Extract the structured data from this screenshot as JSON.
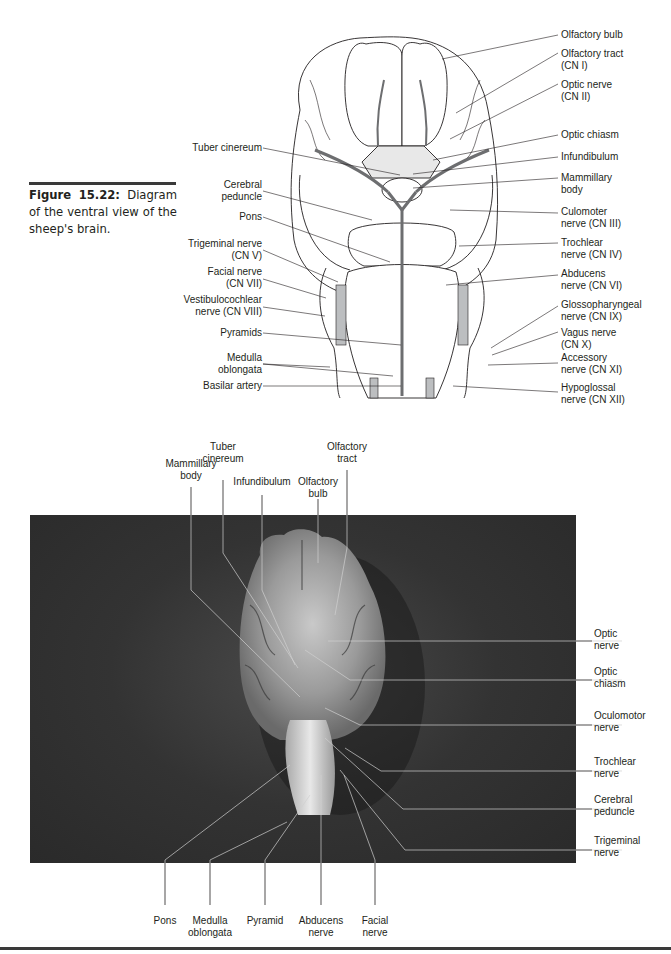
{
  "figure": {
    "number": "Figure 15.22:",
    "caption": "Diagram of the ventral view of the sheep's brain."
  },
  "diagram": {
    "left_labels": [
      {
        "id": "tuber-cinereum",
        "lines": [
          "Tuber cinereum"
        ]
      },
      {
        "id": "cerebral-peduncle",
        "lines": [
          "Cerebral",
          "peduncle"
        ]
      },
      {
        "id": "pons",
        "lines": [
          "Pons"
        ]
      },
      {
        "id": "trigeminal-nerve",
        "lines": [
          "Trigeminal nerve",
          "(CN V)"
        ]
      },
      {
        "id": "facial-nerve",
        "lines": [
          "Facial nerve",
          "(CN VII)"
        ]
      },
      {
        "id": "vestibulocochlear-nerve",
        "lines": [
          "Vestibulocochlear",
          "nerve (CN VIII)"
        ]
      },
      {
        "id": "pyramids",
        "lines": [
          "Pyramids"
        ]
      },
      {
        "id": "medulla-oblongata",
        "lines": [
          "Medulla",
          "oblongata"
        ]
      },
      {
        "id": "basilar-artery",
        "lines": [
          "Basilar artery"
        ]
      }
    ],
    "right_labels": [
      {
        "id": "olfactory-bulb",
        "lines": [
          "Olfactory bulb"
        ]
      },
      {
        "id": "olfactory-tract",
        "lines": [
          "Olfactory tract",
          "(CN I)"
        ]
      },
      {
        "id": "optic-nerve",
        "lines": [
          "Optic nerve",
          "(CN II)"
        ]
      },
      {
        "id": "optic-chiasm",
        "lines": [
          "Optic chiasm"
        ]
      },
      {
        "id": "infundibulum",
        "lines": [
          "Infundibulum"
        ]
      },
      {
        "id": "mammillary-body",
        "lines": [
          "Mammillary",
          "body"
        ]
      },
      {
        "id": "oculomotor-nerve",
        "lines": [
          "Culomoter",
          "nerve (CN III)"
        ]
      },
      {
        "id": "trochlear-nerve",
        "lines": [
          "Trochlear",
          "nerve (CN IV)"
        ]
      },
      {
        "id": "abducens-nerve",
        "lines": [
          "Abducens",
          "nerve (CN VI)"
        ]
      },
      {
        "id": "glossopharyngeal-nerve",
        "lines": [
          "Glossopharyngeal",
          "nerve (CN IX)"
        ]
      },
      {
        "id": "vagus-nerve",
        "lines": [
          "Vagus nerve",
          "(CN X)"
        ]
      },
      {
        "id": "accessory-nerve",
        "lines": [
          "Accessory",
          "nerve (CN XI)"
        ]
      },
      {
        "id": "hypoglossal-nerve",
        "lines": [
          "Hypoglossal",
          "nerve (CN XII)"
        ]
      }
    ]
  },
  "photo": {
    "top_labels": [
      {
        "id": "mammillary-body",
        "lines": [
          "Mammillary",
          "body"
        ]
      },
      {
        "id": "tuber-cinereum",
        "lines": [
          "Tuber",
          "cinereum"
        ]
      },
      {
        "id": "infundibulum",
        "lines": [
          "Infundibulum"
        ]
      },
      {
        "id": "olfactory-bulb",
        "lines": [
          "Olfactory",
          "bulb"
        ]
      },
      {
        "id": "olfactory-tract",
        "lines": [
          "Olfactory",
          "tract"
        ]
      }
    ],
    "right_labels": [
      {
        "id": "optic-nerve",
        "lines": [
          "Optic",
          "nerve"
        ]
      },
      {
        "id": "optic-chiasm",
        "lines": [
          "Optic",
          "chiasm"
        ]
      },
      {
        "id": "oculomotor-nerve",
        "lines": [
          "Oculomotor",
          "nerve"
        ]
      },
      {
        "id": "trochlear-nerve",
        "lines": [
          "Trochlear",
          "nerve"
        ]
      },
      {
        "id": "cerebral-peduncle",
        "lines": [
          "Cerebral",
          "peduncle"
        ]
      },
      {
        "id": "trigeminal-nerve",
        "lines": [
          "Trigeminal",
          "nerve"
        ]
      }
    ],
    "bottom_labels": [
      {
        "id": "pons",
        "lines": [
          "Pons"
        ]
      },
      {
        "id": "medulla-oblongata",
        "lines": [
          "Medulla",
          "oblongata"
        ]
      },
      {
        "id": "pyramid",
        "lines": [
          "Pyramid"
        ]
      },
      {
        "id": "abducens-nerve",
        "lines": [
          "Abducens",
          "nerve"
        ]
      },
      {
        "id": "facial-nerve",
        "lines": [
          "Facial",
          "nerve"
        ]
      }
    ]
  }
}
